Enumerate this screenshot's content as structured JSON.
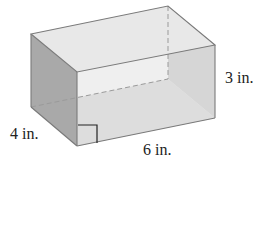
{
  "figure": {
    "type": "rectangular-prism",
    "dimensions": {
      "height": {
        "value": 3,
        "unit": "in.",
        "label": "3 in."
      },
      "depth": {
        "value": 4,
        "unit": "in.",
        "label": "4 in."
      },
      "length": {
        "value": 6,
        "unit": "in.",
        "label": "6 in."
      }
    },
    "right_angle_marker": true,
    "hidden_edges_dashed": true
  },
  "colors": {
    "edge": "#7a7a7a",
    "hidden_edge": "#9a9a9a",
    "top_face": "#e8e8e8",
    "left_face": "#a9a9a9",
    "front_face": "#dedede",
    "back_right_face": "#c6c6c6",
    "bottom_face": "#d4d4d4",
    "text": "#222222"
  }
}
